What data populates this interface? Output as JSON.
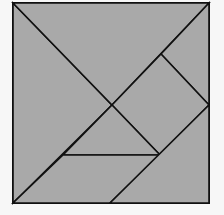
{
  "diagram": {
    "background": "#f7f7f7",
    "fill": "#a9a9a9",
    "stroke": "#111111",
    "stroke_width": 1.6,
    "outer_square": {
      "x": 13,
      "y": 3,
      "width": 196,
      "height": 200
    },
    "pieces": [
      {
        "name": "large-triangle-left",
        "points": "13,3 112,105 13,203"
      },
      {
        "name": "large-triangle-top",
        "points": "13,3 209,3 112,105"
      },
      {
        "name": "small-triangle-top-right",
        "points": "209,3 209,105 161,54"
      },
      {
        "name": "square-piece",
        "points": "161,54 209,105 160,155 112,105"
      },
      {
        "name": "small-triangle-center",
        "points": "112,105 160,155 63,155"
      },
      {
        "name": "parallelogram-bottom",
        "points": "63,155 160,155 110,203 13,203"
      },
      {
        "name": "medium-triangle-bottom-right",
        "points": "209,105 209,203 110,203"
      }
    ]
  }
}
